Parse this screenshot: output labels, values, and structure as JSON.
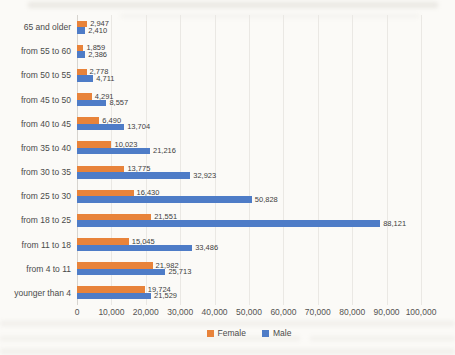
{
  "chart_data": {
    "type": "bar",
    "orientation": "horizontal",
    "title": "",
    "xlabel": "",
    "ylabel": "",
    "grid": true,
    "legend_position": "bottom",
    "xlim": [
      0,
      100000
    ],
    "x_ticks": [
      "0",
      "10,000",
      "20,000",
      "30,000",
      "40,000",
      "50,000",
      "60,000",
      "70,000",
      "80,000",
      "90,000",
      "100,000"
    ],
    "categories": [
      "65 and older",
      "from 55 to 60",
      "from 50 to 55",
      "from 45 to 50",
      "from 40 to 45",
      "from 35 to 40",
      "from 30 to 35",
      "from 25 to 30",
      "from 18 to 25",
      "from 11 to 18",
      "from 4 to 11",
      "younger than 4"
    ],
    "series": [
      {
        "name": "Female",
        "color": "#e8833a",
        "values": [
          2947,
          1859,
          2778,
          4291,
          6490,
          10023,
          13775,
          16430,
          21551,
          15045,
          21982,
          19724
        ],
        "labels": [
          "2,947",
          "1,859",
          "2,778",
          "4,291",
          "6,490",
          "10,023",
          "13,775",
          "16,430",
          "21,551",
          "15,045",
          "21,982",
          "19,724"
        ]
      },
      {
        "name": "Male",
        "color": "#4e7cc7",
        "values": [
          2410,
          2386,
          4711,
          8557,
          13704,
          21216,
          32923,
          50828,
          88121,
          33486,
          25713,
          21529
        ],
        "labels": [
          "2,410",
          "2,386",
          "4,711",
          "8,557",
          "13,704",
          "21,216",
          "32,923",
          "50,828",
          "88,121",
          "33,486",
          "25,713",
          "21,529"
        ]
      }
    ]
  }
}
